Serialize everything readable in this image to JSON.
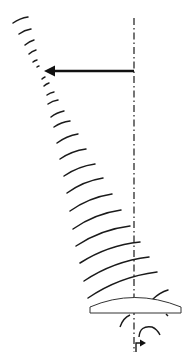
{
  "diagram": {
    "colors": {
      "stroke": "#1a1a1a",
      "background": "#ffffff",
      "lens_fill": "#ffffff"
    },
    "axis": {
      "x": 134,
      "y_start": 18,
      "y_end": 352
    },
    "lateral_arrow": {
      "x_start": 134,
      "x_end": 44,
      "y": 71,
      "direction": "left"
    },
    "lens": {
      "left": 90,
      "right": 181,
      "top_peak": 297,
      "edge_top": 307,
      "bottom": 313
    },
    "rotation_arrow": {
      "symbol": "curved-rotation-arrow",
      "x": 135,
      "y": 345
    },
    "wavefronts": [
      {
        "x1": 13,
        "y1": 23,
        "x2": 28,
        "y2": 17
      },
      {
        "x1": 19,
        "y1": 34,
        "x2": 31,
        "y2": 29
      },
      {
        "x1": 25,
        "y1": 45,
        "x2": 34,
        "y2": 40
      },
      {
        "x1": 29,
        "y1": 54,
        "x2": 36,
        "y2": 50
      },
      {
        "x1": 33,
        "y1": 62,
        "x2": 37,
        "y2": 60
      },
      {
        "x1": 37,
        "y1": 67,
        "x2": 39,
        "y2": 66
      },
      {
        "x1": 42,
        "y1": 79,
        "x2": 45,
        "y2": 77
      },
      {
        "x1": 44,
        "y1": 86,
        "x2": 49,
        "y2": 83
      },
      {
        "x1": 47,
        "y1": 95,
        "x2": 54,
        "y2": 92
      },
      {
        "x1": 48,
        "y1": 104,
        "x2": 58,
        "y2": 100
      },
      {
        "x1": 51,
        "y1": 117,
        "x2": 64,
        "y2": 111
      },
      {
        "x1": 54,
        "y1": 127,
        "x2": 70,
        "y2": 121
      },
      {
        "x1": 57,
        "y1": 143,
        "x2": 78,
        "y2": 134
      },
      {
        "x1": 60,
        "y1": 159,
        "x2": 86,
        "y2": 149
      },
      {
        "x1": 64,
        "y1": 176,
        "x2": 95,
        "y2": 164
      },
      {
        "x1": 67,
        "y1": 193,
        "x2": 103,
        "y2": 178
      },
      {
        "x1": 70,
        "y1": 211,
        "x2": 112,
        "y2": 194
      },
      {
        "x1": 73,
        "y1": 229,
        "x2": 121,
        "y2": 210
      },
      {
        "x1": 76,
        "y1": 246,
        "x2": 130,
        "y2": 226
      },
      {
        "x1": 80,
        "y1": 263,
        "x2": 140,
        "y2": 242
      },
      {
        "x1": 84,
        "y1": 281,
        "x2": 149,
        "y2": 257
      },
      {
        "x1": 88,
        "y1": 298,
        "x2": 157,
        "y2": 272
      },
      {
        "x1": 153,
        "y1": 299,
        "x2": 168,
        "y2": 290
      }
    ]
  }
}
